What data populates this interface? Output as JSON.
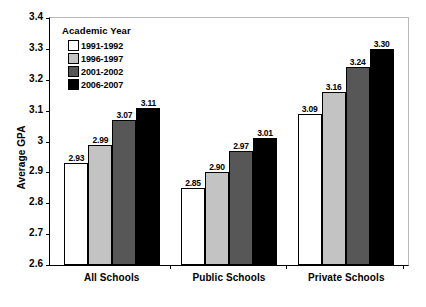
{
  "chart_data": {
    "type": "bar",
    "title": "",
    "xlabel": "",
    "ylabel": "Average GPA",
    "ylim": [
      2.6,
      3.4
    ],
    "ytick_labels": [
      "3.4",
      "3.3",
      "3.2",
      "3.1",
      "3",
      "2.9",
      "2.8",
      "2.7",
      "2.6"
    ],
    "ytick_values": [
      3.4,
      3.3,
      3.2,
      3.1,
      3.0,
      2.9,
      2.8,
      2.7,
      2.6
    ],
    "grid": false,
    "legend_position": "top-left",
    "legend_title": "Academic Year",
    "categories": [
      "All Schools",
      "Public Schools",
      "Private Schools"
    ],
    "series": [
      {
        "name": "1991-1992",
        "color": "#ffffff",
        "values": [
          2.93,
          2.85,
          3.09
        ],
        "labels": [
          "2.93",
          "2.85",
          "3.09"
        ]
      },
      {
        "name": "1996-1997",
        "color": "#c3c3c3",
        "values": [
          2.99,
          2.9,
          3.16
        ],
        "labels": [
          "2.99",
          "2.90",
          "3.16"
        ]
      },
      {
        "name": "2001-2002",
        "color": "#575757",
        "values": [
          3.07,
          2.97,
          3.24
        ],
        "labels": [
          "3.07",
          "2.97",
          "3.24"
        ]
      },
      {
        "name": "2006-2007",
        "color": "#000000",
        "values": [
          3.11,
          3.01,
          3.3
        ],
        "labels": [
          "3.11",
          "3.01",
          "3.30"
        ]
      }
    ]
  }
}
